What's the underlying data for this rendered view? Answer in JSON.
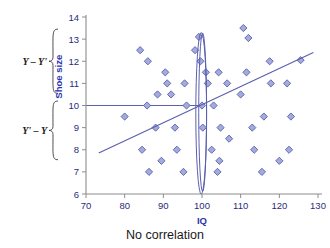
{
  "caption": "No correlation",
  "chart_data": {
    "type": "scatter",
    "title": "",
    "subtitle": "",
    "xlabel": "IQ",
    "ylabel": "Shoe size",
    "xlim": [
      70,
      130
    ],
    "ylim": [
      6,
      14
    ],
    "xticks": [
      70,
      80,
      90,
      100,
      110,
      120,
      130
    ],
    "yticks": [
      6,
      7,
      8,
      9,
      10,
      11,
      12,
      13,
      14
    ],
    "xtick_labels": [
      "70",
      "80",
      "90",
      "100",
      "110",
      "120",
      "130"
    ],
    "ytick_labels": [
      "6",
      "7",
      "8",
      "9",
      "10",
      "11",
      "12",
      "13",
      "14"
    ],
    "grid": false,
    "legend": "none",
    "marker_shape": "diamond",
    "marker_fill": "#a3abdd",
    "marker_edge": "#5a5fae",
    "axis_color": "#8c8c8c",
    "label_color": "#2b32b2",
    "points": [
      [
        80.0,
        9.5
      ],
      [
        84.0,
        12.5
      ],
      [
        84.5,
        8.0
      ],
      [
        85.8,
        10.0
      ],
      [
        86.0,
        12.0
      ],
      [
        86.3,
        7.0
      ],
      [
        88.0,
        9.0
      ],
      [
        88.5,
        10.5
      ],
      [
        89.5,
        7.5
      ],
      [
        90.5,
        11.5
      ],
      [
        91.0,
        11.0
      ],
      [
        92.0,
        10.5
      ],
      [
        93.0,
        9.0
      ],
      [
        93.5,
        8.0
      ],
      [
        95.2,
        7.0
      ],
      [
        95.5,
        11.0
      ],
      [
        96.0,
        10.0
      ],
      [
        98.2,
        12.5
      ],
      [
        99.2,
        13.1
      ],
      [
        99.6,
        12.0
      ],
      [
        100.0,
        10.0
      ],
      [
        100.2,
        9.0
      ],
      [
        101.5,
        11.0
      ],
      [
        101.0,
        11.5
      ],
      [
        102.5,
        8.0
      ],
      [
        103.0,
        10.0
      ],
      [
        104.0,
        7.0
      ],
      [
        104.5,
        7.5
      ],
      [
        104.3,
        11.5
      ],
      [
        104.8,
        9.0
      ],
      [
        106.5,
        11.0
      ],
      [
        107.0,
        8.5
      ],
      [
        110.0,
        10.5
      ],
      [
        110.7,
        13.5
      ],
      [
        111.5,
        11.5
      ],
      [
        112.0,
        13.05
      ],
      [
        113.0,
        9.0
      ],
      [
        113.5,
        8.0
      ],
      [
        115.5,
        7.0
      ],
      [
        116.0,
        9.5
      ],
      [
        117.5,
        12.0
      ],
      [
        117.8,
        11.0
      ],
      [
        120.0,
        7.5
      ],
      [
        122.0,
        11.0
      ],
      [
        122.5,
        8.0
      ],
      [
        123.0,
        9.5
      ],
      [
        125.5,
        12.05
      ]
    ],
    "regression_line": {
      "x": [
        73.3,
        128.8
      ],
      "y": [
        7.85,
        12.4
      ],
      "color": "#5a5fae"
    },
    "guide_line_horizontal": {
      "y": 10.0,
      "x_start": 70.0,
      "x_end": 100.2,
      "color": "#5a5fae"
    },
    "ellipse": {
      "center_x": 99.8,
      "center_y": 9.65,
      "semi_width": 1.4,
      "semi_height": 3.65,
      "note": "narrow vertical lens at IQ = 100",
      "color": "#5a5fae"
    },
    "annotations": [
      {
        "label": "Y – Y'",
        "brace_y_top": 13.45,
        "brace_y_bottom": 10.55,
        "type": "brace-left"
      },
      {
        "label": "Y' – Y",
        "brace_y_top": 10.2,
        "brace_y_bottom": 7.55,
        "type": "brace-left"
      }
    ]
  }
}
